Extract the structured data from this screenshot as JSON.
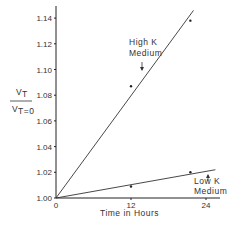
{
  "chart_data": {
    "type": "line",
    "title": "",
    "xlabel": "Time in Hours",
    "ylabel": "V_T / V_T=0",
    "ylabel_numerator": "V_T",
    "ylabel_denominator": "V_T=0",
    "xlim": [
      0,
      26
    ],
    "ylim": [
      1.0,
      1.15
    ],
    "x_ticks": [
      0,
      12,
      24
    ],
    "x_tick_labels": [
      "0",
      "12",
      "24"
    ],
    "y_ticks": [
      1.0,
      1.02,
      1.04,
      1.06,
      1.08,
      1.1,
      1.12,
      1.14
    ],
    "y_tick_labels": [
      "1.00",
      "1.02",
      "1.04",
      "1.06",
      "1.08",
      "1.10",
      "1.12",
      "1.14"
    ],
    "grid": false,
    "series": [
      {
        "name": "High K Medium",
        "label_line1": "High  K",
        "label_line2": "Medium",
        "fit_line": {
          "x": [
            0,
            22
          ],
          "y": [
            1.0,
            1.146
          ]
        },
        "points": [
          {
            "x": 12,
            "y": 1.087
          },
          {
            "x": 21.5,
            "y": 1.138
          }
        ]
      },
      {
        "name": "Low K Medium",
        "label_line1": "Low K",
        "label_line2": "Medium",
        "fit_line": {
          "x": [
            0,
            25.5
          ],
          "y": [
            1.0,
            1.022
          ]
        },
        "points": [
          {
            "x": 12,
            "y": 1.009
          },
          {
            "x": 21.5,
            "y": 1.02
          }
        ]
      }
    ]
  }
}
